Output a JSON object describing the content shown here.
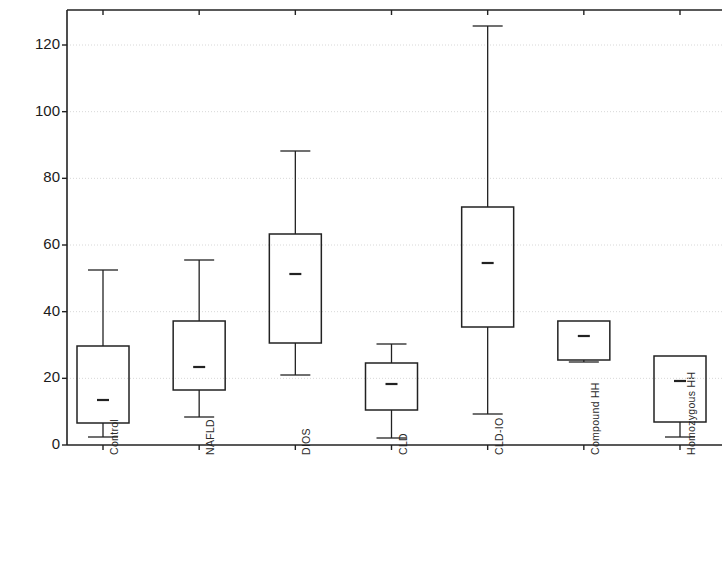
{
  "chart_data": {
    "type": "box",
    "title": "",
    "subtitle": "",
    "xlabel": "",
    "ylabel": "Hepcidin",
    "ylim": [
      0,
      130
    ],
    "ytick_values": [
      0,
      20,
      40,
      60,
      80,
      100,
      120
    ],
    "ytick_labels": [
      "0",
      "20",
      "40",
      "60",
      "80",
      "100",
      "120"
    ],
    "grid": true,
    "grid_axis": "y",
    "legend": null,
    "legend_position": "none",
    "categories": [
      "Control",
      "NAFLD",
      "DIOS",
      "CLD",
      "CLD-IO",
      "Compound HH",
      "Homozygous HH"
    ],
    "boxes": [
      {
        "category": "Control",
        "whisker_low": 2.4,
        "q1": 6.6,
        "median": 13.5,
        "q3": 29.7,
        "whisker_high": 52.5
      },
      {
        "category": "NAFLD",
        "whisker_low": 8.4,
        "q1": 16.5,
        "median": 23.4,
        "q3": 37.2,
        "whisker_high": 55.5
      },
      {
        "category": "DIOS",
        "whisker_low": 21.0,
        "q1": 30.6,
        "median": 51.3,
        "q3": 63.3,
        "whisker_high": 88.2
      },
      {
        "category": "CLD",
        "whisker_low": 2.1,
        "q1": 10.5,
        "median": 18.3,
        "q3": 24.6,
        "whisker_high": 30.3
      },
      {
        "category": "CLD-IO",
        "whisker_low": 9.3,
        "q1": 35.4,
        "median": 54.6,
        "q3": 71.4,
        "whisker_high": 125.7
      },
      {
        "category": "Compound HH",
        "whisker_low": 24.9,
        "q1": 25.5,
        "median": 32.7,
        "q3": 37.2,
        "whisker_high": 37.2
      },
      {
        "category": "Homozygous HH",
        "whisker_low": 2.4,
        "q1": 6.9,
        "median": 19.2,
        "q3": 26.7,
        "whisker_high": 26.7
      }
    ]
  },
  "axes": {
    "y_axis_title": "Hepcidin",
    "y_ticks": [
      "0",
      "20",
      "40",
      "60",
      "80",
      "100",
      "120"
    ],
    "x_ticks": [
      "Control",
      "NAFLD",
      "DIOS",
      "CLD",
      "CLD-IO",
      "Compound HH",
      "Homozygous HH"
    ]
  },
  "colors": {
    "line": "#222222",
    "grid": "#d8d8d8",
    "background": "#ffffff",
    "text": "#1b1b1b"
  }
}
